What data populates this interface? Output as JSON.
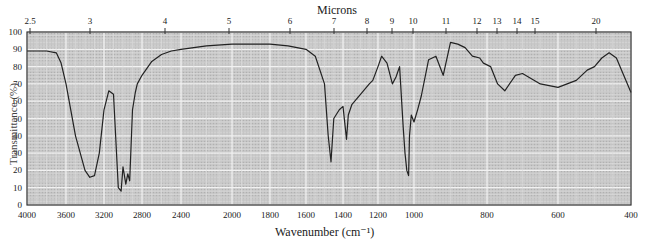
{
  "chart_data": {
    "type": "line",
    "title": "",
    "top_axis_label": "Microns",
    "xlabel": "Wavenumber (cm⁻¹)",
    "ylabel": "Transmittance (%)",
    "xlim": [
      4000,
      400
    ],
    "ylim": [
      0,
      100
    ],
    "grid": true,
    "legend": null,
    "y_ticks": [
      0,
      10,
      20,
      30,
      40,
      50,
      60,
      70,
      80,
      90,
      100
    ],
    "x_ticks": [
      4000,
      3600,
      3200,
      2800,
      2400,
      2000,
      1800,
      1600,
      1400,
      1200,
      1000,
      800,
      600,
      400
    ],
    "micron_ticks": [
      "2.5",
      "3",
      "4",
      "5",
      "6",
      "7",
      "8",
      "9",
      "10",
      "11",
      "12",
      "13",
      "14",
      "15",
      "20"
    ],
    "series": [
      {
        "name": "IR spectrum",
        "x": [
          4000,
          3800,
          3700,
          3650,
          3600,
          3500,
          3400,
          3350,
          3300,
          3250,
          3200,
          3150,
          3100,
          3050,
          3020,
          3000,
          2970,
          2950,
          2930,
          2900,
          2870,
          2850,
          2800,
          2700,
          2600,
          2500,
          2400,
          2200,
          2000,
          1800,
          1700,
          1650,
          1600,
          1550,
          1500,
          1480,
          1465,
          1450,
          1420,
          1400,
          1380,
          1370,
          1350,
          1300,
          1250,
          1230,
          1200,
          1180,
          1150,
          1120,
          1100,
          1080,
          1060,
          1050,
          1040,
          1030,
          1025,
          1015,
          1000,
          990,
          980,
          960,
          940,
          920,
          900,
          880,
          860,
          840,
          820,
          810,
          790,
          770,
          750,
          720,
          700,
          650,
          600,
          550,
          520,
          500,
          480,
          460,
          440,
          420,
          400
        ],
        "values": [
          89,
          89,
          88,
          82,
          70,
          40,
          20,
          16,
          17,
          30,
          55,
          66,
          64,
          10,
          8,
          22,
          12,
          18,
          14,
          55,
          65,
          70,
          75,
          83,
          87,
          89,
          90,
          92,
          93,
          93,
          92,
          91,
          90,
          86,
          70,
          40,
          25,
          50,
          55,
          57,
          38,
          52,
          58,
          64,
          70,
          72,
          80,
          86,
          82,
          70,
          74,
          80,
          45,
          30,
          20,
          17,
          40,
          52,
          48,
          55,
          63,
          84,
          86,
          75,
          94,
          93,
          91,
          86,
          85,
          82,
          80,
          70,
          66,
          75,
          76,
          70,
          68,
          72,
          78,
          80,
          85,
          88,
          85,
          75,
          65
        ]
      }
    ],
    "pixel_map": {
      "x_px": [
        27,
        66,
        104,
        142,
        181,
        232,
        270,
        306,
        343,
        378,
        414,
        487,
        558,
        631
      ],
      "x_val": [
        4000,
        3600,
        3200,
        2800,
        2400,
        2000,
        1800,
        1600,
        1400,
        1200,
        1000,
        800,
        600,
        400
      ],
      "y_top_px": 32,
      "y_bottom_px": 205
    },
    "micron_tick_px": [
      30,
      90,
      165,
      229,
      290,
      334,
      367,
      392,
      413,
      446,
      477,
      497,
      517,
      535,
      596
    ]
  },
  "colors": {
    "plot_bg": "#c8c8c8",
    "grid_major": "#f2f2f2",
    "grid_minor": "#dedede",
    "curve": "#222222",
    "frame": "#333333"
  }
}
